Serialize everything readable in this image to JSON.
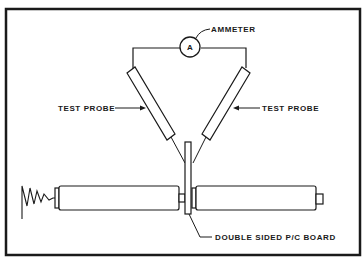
{
  "figure": {
    "type": "test setup schematic",
    "labels": {
      "ammeter": "AMMETER",
      "ammeter_symbol": "A",
      "probe_left": "TEST PROBE",
      "probe_right": "TEST PROBE",
      "board": "DOUBLE SIDED P/C BOARD"
    },
    "components": [
      {
        "name": "ammeter",
        "symbol": "A"
      },
      {
        "name": "test-probe-left"
      },
      {
        "name": "test-probe-right"
      },
      {
        "name": "pc-board",
        "description": "double sided"
      },
      {
        "name": "roller-left"
      },
      {
        "name": "roller-right"
      },
      {
        "name": "spring"
      }
    ],
    "colors": {
      "line": "#1a1a1a",
      "background": "#ffffff"
    }
  }
}
